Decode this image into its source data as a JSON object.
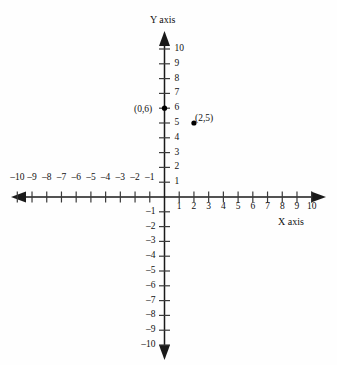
{
  "chart_data": {
    "type": "scatter",
    "title": "",
    "xlabel": "X axis",
    "ylabel": "Y axis",
    "xlim": [
      -10,
      10
    ],
    "ylim": [
      -10,
      10
    ],
    "grid": false,
    "legend": null,
    "x_ticks": [
      -10,
      -9,
      -8,
      -7,
      -6,
      -5,
      -4,
      -3,
      -2,
      -1,
      1,
      2,
      3,
      4,
      5,
      6,
      7,
      8,
      9,
      10
    ],
    "y_ticks": [
      10,
      9,
      8,
      7,
      6,
      5,
      4,
      3,
      2,
      1,
      -1,
      -2,
      -3,
      -4,
      -5,
      -6,
      -7,
      -8,
      -9,
      -10
    ],
    "x_tick_labels": [
      "–10",
      "–9",
      "–8",
      "–7",
      "–6",
      "–5",
      "–4",
      "–3",
      "–2",
      "–1",
      "1",
      "2",
      "3",
      "4",
      "5",
      "6",
      "7",
      "8",
      "9",
      "10"
    ],
    "y_tick_labels": [
      "10",
      "9",
      "8",
      "7",
      "6",
      "5",
      "4",
      "3",
      "2",
      "1",
      "–1",
      "–2",
      "–3",
      "–4",
      "–5",
      "–6",
      "–7",
      "–8",
      "–9",
      "–10"
    ],
    "points": [
      {
        "x": 0,
        "y": 6,
        "label": "(0,6)",
        "label_side": "left"
      },
      {
        "x": 2,
        "y": 5,
        "label": "(2,5)",
        "label_side": "right"
      }
    ],
    "axis_color": "#1a1a1a",
    "point_color": "#000000",
    "background_color": "#fefefe"
  },
  "labels": {
    "y_axis_title": "Y axis",
    "x_axis_title": "X axis",
    "point_0_6": "(0,6)",
    "point_2_5": "(2,5)"
  }
}
